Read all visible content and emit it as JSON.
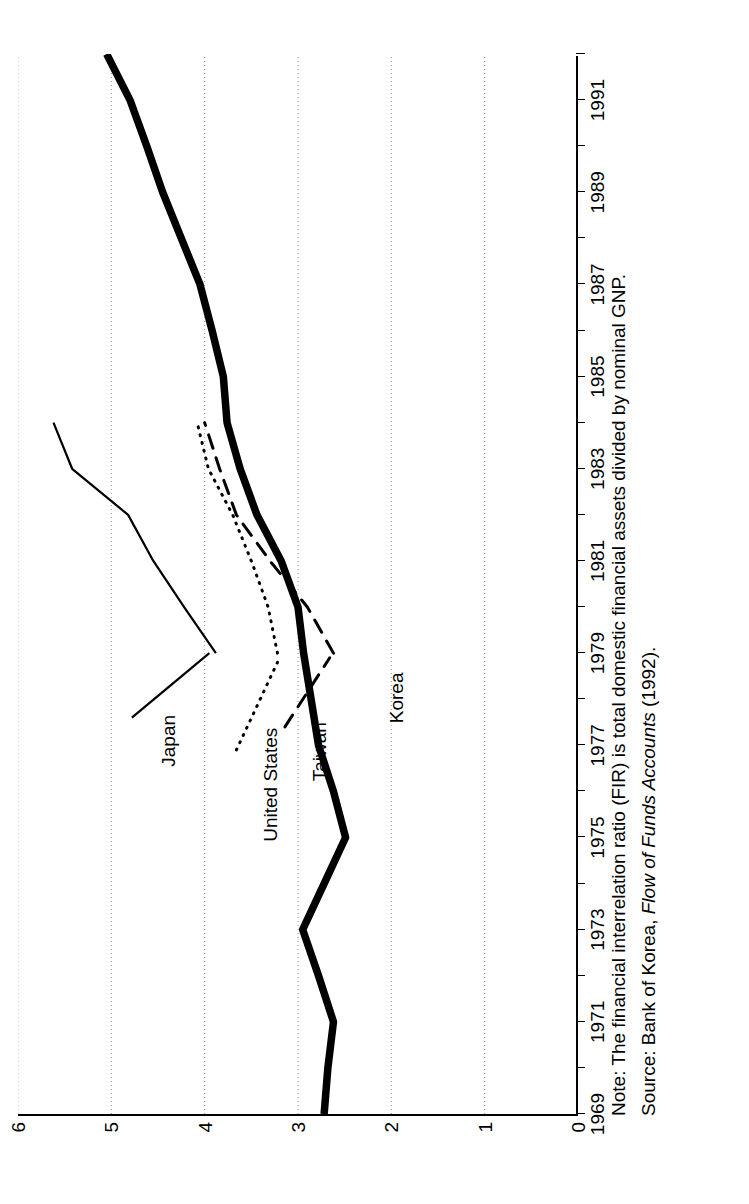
{
  "figure": {
    "notes": [
      "Note: The financial interrelation ratio (FIR) is total domestic financial assets divided by nominal GNP.",
      "Source: Bank of Korea, "
    ],
    "source_prefix": "Source: Bank of Korea, ",
    "source_italic": "Flow of Funds Accounts",
    "source_suffix": " (1992).",
    "note_text": "Note: The financial interrelation ratio (FIR) is total domestic financial assets divided by nominal GNP."
  },
  "chart_data": {
    "type": "line",
    "title": "",
    "xlabel": "",
    "ylabel": "",
    "xlim": [
      1969,
      1992
    ],
    "ylim": [
      0,
      6
    ],
    "yticks": [
      0,
      1,
      2,
      3,
      4,
      5,
      6
    ],
    "xticks": [
      1969,
      1971,
      1973,
      1975,
      1977,
      1979,
      1981,
      1983,
      1985,
      1987,
      1989,
      1991
    ],
    "xtick_labels": [
      "1969",
      "1971",
      "1973",
      "1975",
      "1977",
      "1979",
      "1981",
      "1983",
      "1985",
      "1987",
      "1989",
      "1991"
    ],
    "ytick_labels": [
      "0",
      "1",
      "2",
      "3",
      "4",
      "5",
      "6"
    ],
    "grid": "y-gridlines-dotted",
    "legend": "inline-annotations",
    "series": [
      {
        "name": "Korea",
        "style": "solid-thick",
        "color": "#000000",
        "x": [
          1969,
          1970,
          1971,
          1972,
          1973,
          1974,
          1975,
          1976,
          1977,
          1978,
          1979,
          1980,
          1981,
          1982,
          1983,
          1984,
          1985,
          1986,
          1987,
          1988,
          1989,
          1990,
          1991,
          1992
        ],
        "values": [
          2.72,
          2.68,
          2.62,
          2.78,
          2.95,
          2.72,
          2.49,
          2.62,
          2.78,
          2.86,
          2.94,
          3.0,
          3.18,
          3.44,
          3.62,
          3.76,
          3.8,
          3.92,
          4.05,
          4.25,
          4.45,
          4.62,
          4.8,
          5.05
        ]
      },
      {
        "name": "Japan",
        "style": "solid-thin",
        "color": "#000000",
        "x": [
          1979,
          1980,
          1981,
          1982,
          1983,
          1984
        ],
        "values": [
          3.88,
          4.22,
          4.55,
          4.82,
          5.42,
          5.62
        ]
      },
      {
        "name": "United States",
        "style": "dotted",
        "color": "#000000",
        "x": [
          1979,
          1980,
          1981,
          1982,
          1983,
          1984
        ],
        "values": [
          3.22,
          3.32,
          3.5,
          3.7,
          3.96,
          4.08
        ]
      },
      {
        "name": "Taiwan",
        "style": "dashed",
        "color": "#000000",
        "x": [
          1979,
          1980,
          1981,
          1982,
          1983,
          1984
        ],
        "values": [
          2.62,
          2.9,
          3.3,
          3.66,
          3.84,
          4.0
        ]
      }
    ],
    "annotations": [
      {
        "text": "Japan",
        "series": "Japan"
      },
      {
        "text": "United States",
        "series": "United States"
      },
      {
        "text": "Taiwan",
        "series": "Taiwan"
      },
      {
        "text": "Korea",
        "series": "Korea"
      }
    ]
  }
}
